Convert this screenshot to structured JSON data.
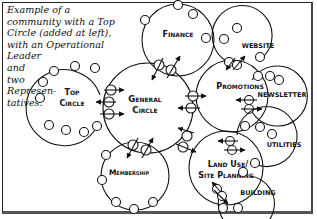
{
  "caption": {
    "lines": [
      "Example of a",
      "community with a Top",
      "Circle (added at left),",
      "with an Operational",
      "Leader",
      "and",
      "two",
      "Represen-",
      "tatives."
    ]
  },
  "circles": {
    "top": {
      "line1": "Top",
      "line2": "Circle"
    },
    "general": {
      "line1": "General",
      "line2": "Circle"
    },
    "finance": {
      "line1": "Finance"
    },
    "promotions": {
      "line1": "Promotions"
    },
    "website": {
      "line1": "WEBSITE"
    },
    "newsletter": {
      "line1": "NEWSLETTER"
    },
    "membership": {
      "line1": "Membership"
    },
    "land_use": {
      "line1": "Land Use/",
      "line2": "Site Planning"
    },
    "utilities": {
      "line1": "UTILITIES"
    },
    "building": {
      "line1": "BUILDING"
    }
  },
  "colors": {
    "ink": "#111111",
    "background": "#ffffff"
  }
}
